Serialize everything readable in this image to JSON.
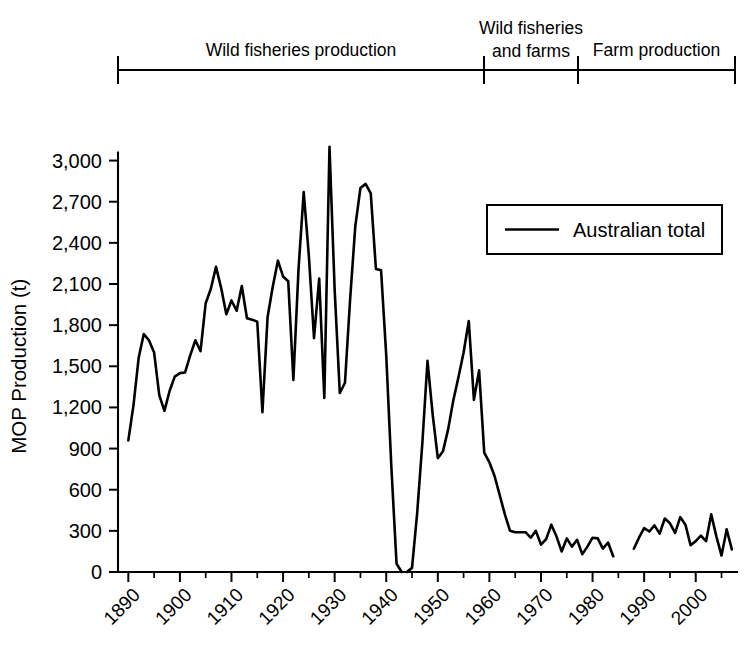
{
  "chart_data": {
    "type": "line",
    "title": "",
    "xlabel": "",
    "ylabel": "MOP Production (t)",
    "xlim": [
      1888,
      2008
    ],
    "ylim": [
      0,
      3150
    ],
    "grid": false,
    "legend_position": "upper-right",
    "legend_entries": [
      "Australian total"
    ],
    "y_ticks": [
      0,
      300,
      600,
      900,
      1200,
      1500,
      1800,
      2100,
      2400,
      2700,
      3000
    ],
    "y_tick_labels": [
      "0",
      "300",
      "600",
      "900",
      "1,200",
      "1,500",
      "1,800",
      "2,100",
      "2,400",
      "2,700",
      "3,000"
    ],
    "x_ticks": [
      1890,
      1900,
      1910,
      1920,
      1930,
      1940,
      1950,
      1960,
      1970,
      1980,
      1990,
      2000
    ],
    "x_tick_labels": [
      "1890",
      "1900",
      "1910",
      "1920",
      "1930",
      "1940",
      "1950",
      "1960",
      "1970",
      "1980",
      "1990",
      "2000"
    ],
    "x_minor_tick_step": 5,
    "series": [
      {
        "name": "Australian total",
        "color": "#000000",
        "segments": [
          {
            "x": [
              1890,
              1891,
              1892,
              1893,
              1894,
              1895,
              1896,
              1897,
              1898,
              1899,
              1900,
              1901,
              1902,
              1903,
              1904,
              1905,
              1906,
              1907,
              1908,
              1909,
              1910,
              1911,
              1912,
              1913,
              1914,
              1915,
              1916,
              1917,
              1918,
              1919,
              1920,
              1921,
              1922,
              1923,
              1924,
              1925,
              1926,
              1927,
              1928,
              1929,
              1930,
              1931,
              1932,
              1933,
              1934,
              1935,
              1936,
              1937,
              1938,
              1939,
              1940,
              1941,
              1942,
              1943
            ],
            "y": [
              960,
              1215,
              1560,
              1735,
              1690,
              1600,
              1290,
              1175,
              1320,
              1425,
              1450,
              1455,
              1580,
              1690,
              1610,
              1960,
              2065,
              2225,
              2070,
              1880,
              1980,
              1905,
              2085,
              1850,
              1840,
              1825,
              1165,
              1860,
              2080,
              2270,
              2155,
              2120,
              1400,
              2210,
              2770,
              2305,
              1705,
              2140,
              1270,
              3100,
              2060,
              1305,
              1380,
              1990,
              2520,
              2800,
              2830,
              2760,
              2210,
              2200,
              1580,
              760,
              60,
              0
            ]
          },
          {
            "x": [
              1944,
              1945,
              1946,
              1947,
              1948,
              1949,
              1950,
              1951,
              1952,
              1953,
              1954,
              1955,
              1956,
              1957,
              1958,
              1959,
              1960,
              1961,
              1962,
              1963,
              1964,
              1965,
              1966,
              1967,
              1968,
              1969,
              1970,
              1971,
              1972,
              1973,
              1974,
              1975,
              1976,
              1977,
              1978,
              1979,
              1980,
              1981,
              1982,
              1983,
              1984
            ],
            "y": [
              0,
              30,
              430,
              940,
              1540,
              1150,
              830,
              880,
              1040,
              1250,
              1420,
              1600,
              1830,
              1255,
              1470,
              870,
              800,
              700,
              560,
              420,
              300,
              290,
              290,
              290,
              250,
              300,
              200,
              240,
              345,
              260,
              150,
              245,
              185,
              235,
              130,
              185,
              250,
              245,
              170,
              215,
              115
            ]
          },
          {
            "x": [
              1988,
              1989,
              1990,
              1991,
              1992,
              1993,
              1994,
              1995,
              1996,
              1997,
              1998,
              1999,
              2000,
              2001,
              2002,
              2003,
              2004,
              2005,
              2006
            ],
            "y": [
              170,
              250,
              320,
              295,
              340,
              280,
              390,
              355,
              285,
              400,
              345,
              195,
              225,
              265,
              225,
              420,
              260,
              120,
              310
            ]
          },
          {
            "x": [
              2006,
              2007
            ],
            "y": [
              310,
              165
            ]
          }
        ]
      }
    ],
    "period_brackets": [
      {
        "label_lines": [
          "Wild fisheries production"
        ],
        "start_year": 1890,
        "end_year": 1960
      },
      {
        "label_lines": [
          "Wild fisheries",
          "and farms"
        ],
        "start_year": 1960,
        "end_year": 1978
      },
      {
        "label_lines": [
          "Farm production"
        ],
        "start_year": 1978,
        "end_year": 2007
      }
    ]
  }
}
